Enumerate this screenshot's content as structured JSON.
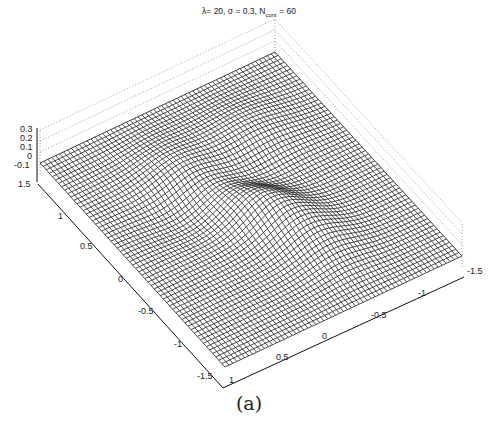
{
  "figure": {
    "title_prefix": "λ= 20, σ = 0.3, N",
    "title_sub": "cont",
    "title_suffix": " = 60",
    "caption": "(a)"
  },
  "chart_data": {
    "type": "surface",
    "xlabel": "",
    "ylabel": "",
    "zlabel": "",
    "x_ticks": [
      "-1.5",
      "-1",
      "-0.5",
      "0",
      "0.5",
      "1"
    ],
    "y_ticks": [
      "1.5",
      "1",
      "0.5",
      "0",
      "-0.5",
      "-1",
      "-1.5"
    ],
    "z_ticks": [
      "0.3",
      "0.2",
      "0.1",
      "0",
      "-0.1"
    ],
    "xlim": [
      -1.5,
      1.5
    ],
    "ylim": [
      -1.5,
      1.5
    ],
    "zlim": [
      -0.1,
      0.3
    ],
    "grid": true,
    "mesh_resolution": 60,
    "render": "wireframe mesh, black lines on white"
  },
  "projection": {
    "corner_left": [
      40,
      163
    ],
    "corner_top": [
      275,
      52
    ],
    "corner_right": [
      462,
      256
    ],
    "corner_bottom": [
      225,
      367
    ],
    "z_scale_px_per_unit": 110
  },
  "axis_labels": {
    "z": [
      {
        "text": "0.3",
        "x": 20,
        "y": 132
      },
      {
        "text": "0.2",
        "x": 20,
        "y": 141
      },
      {
        "text": "0.1",
        "x": 20,
        "y": 150
      },
      {
        "text": "0",
        "x": 27,
        "y": 159
      },
      {
        "text": "-0.1",
        "x": 14,
        "y": 168
      }
    ],
    "left": [
      {
        "text": "1.5",
        "x": 18,
        "y": 187
      },
      {
        "text": "1",
        "x": 58,
        "y": 219
      },
      {
        "text": "0.5",
        "x": 80,
        "y": 249
      },
      {
        "text": "0",
        "x": 118,
        "y": 282
      },
      {
        "text": "-0.5",
        "x": 138,
        "y": 314
      },
      {
        "text": "-1",
        "x": 174,
        "y": 347
      },
      {
        "text": "-1.5",
        "x": 197,
        "y": 379
      }
    ],
    "right": [
      {
        "text": "1",
        "x": 229,
        "y": 383
      },
      {
        "text": "0.5",
        "x": 276,
        "y": 360
      },
      {
        "text": "0",
        "x": 322,
        "y": 339
      },
      {
        "text": "-0.5",
        "x": 371,
        "y": 318
      },
      {
        "text": "-1",
        "x": 418,
        "y": 296
      },
      {
        "text": "-1.5",
        "x": 467,
        "y": 274
      }
    ]
  }
}
